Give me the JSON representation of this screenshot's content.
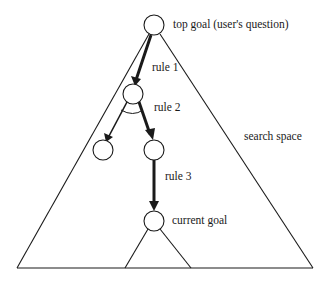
{
  "diagram": {
    "labels": {
      "top_goal": "top goal (user's question)",
      "rule1": "rule 1",
      "rule2": "rule 2",
      "rule3": "rule 3",
      "search_space": "search space",
      "current_goal": "current goal"
    },
    "nodes": [
      {
        "id": "top-goal",
        "x": 154,
        "y": 25,
        "r": 10
      },
      {
        "id": "rule1-node",
        "x": 133,
        "y": 94,
        "r": 10
      },
      {
        "id": "left-child",
        "x": 103,
        "y": 150,
        "r": 10
      },
      {
        "id": "right-child",
        "x": 154,
        "y": 150,
        "r": 10
      },
      {
        "id": "current-goal",
        "x": 154,
        "y": 221,
        "r": 10
      }
    ],
    "colors": {
      "stroke": "#1a1a1a",
      "background": "#ffffff"
    }
  }
}
